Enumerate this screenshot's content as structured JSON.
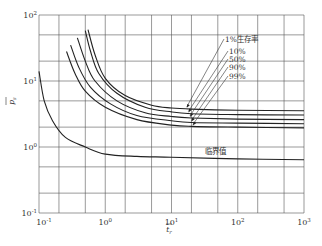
{
  "chart_data": {
    "type": "line",
    "title": "",
    "xlabel": "t_r (bar)",
    "ylabel": "p_s (bar)",
    "x_scale": "log",
    "y_scale": "log",
    "xlim": [
      0.1,
      1000
    ],
    "ylim": [
      0.1,
      100
    ],
    "x_ticks": [
      {
        "value": 0.1,
        "base": "10",
        "exp": "-1"
      },
      {
        "value": 1,
        "base": "10",
        "exp": "0"
      },
      {
        "value": 10,
        "base": "10",
        "exp": "1"
      },
      {
        "value": 100,
        "base": "10",
        "exp": "2"
      },
      {
        "value": 1000,
        "base": "10",
        "exp": "3"
      }
    ],
    "y_ticks": [
      {
        "value": 0.1,
        "base": "10",
        "exp": "-1"
      },
      {
        "value": 1,
        "base": "10",
        "exp": "0"
      },
      {
        "value": 10,
        "base": "10",
        "exp": "1"
      },
      {
        "value": 100,
        "base": "10",
        "exp": "2"
      }
    ],
    "x_grid": [
      0.1,
      0.2,
      0.5,
      1,
      2,
      5,
      10,
      20,
      50,
      100,
      200,
      500,
      1000
    ],
    "y_grid": [
      0.1,
      0.2,
      0.5,
      1,
      2,
      5,
      10,
      20,
      50,
      100
    ],
    "grid": true,
    "series": [
      {
        "name": "1%生存率",
        "points": [
          [
            0.55,
            60
          ],
          [
            0.7,
            25
          ],
          [
            1,
            11
          ],
          [
            2,
            6
          ],
          [
            5,
            4.3
          ],
          [
            10,
            3.9
          ],
          [
            20,
            3.75
          ],
          [
            100,
            3.6
          ],
          [
            1000,
            3.55
          ]
        ]
      },
      {
        "name": "10%",
        "points": [
          [
            0.5,
            58
          ],
          [
            0.6,
            28
          ],
          [
            0.8,
            13
          ],
          [
            1.5,
            6.5
          ],
          [
            4,
            4
          ],
          [
            10,
            3.4
          ],
          [
            20,
            3.2
          ],
          [
            100,
            3.1
          ],
          [
            1000,
            3.05
          ]
        ]
      },
      {
        "name": "50%",
        "points": [
          [
            0.38,
            45
          ],
          [
            0.5,
            20
          ],
          [
            0.7,
            10
          ],
          [
            1.5,
            5
          ],
          [
            4,
            3.3
          ],
          [
            10,
            2.9
          ],
          [
            20,
            2.75
          ],
          [
            100,
            2.65
          ],
          [
            1000,
            2.6
          ]
        ]
      },
      {
        "name": "90%",
        "points": [
          [
            0.3,
            35
          ],
          [
            0.4,
            16
          ],
          [
            0.6,
            8
          ],
          [
            1.2,
            4.5
          ],
          [
            3,
            3
          ],
          [
            10,
            2.5
          ],
          [
            20,
            2.35
          ],
          [
            100,
            2.3
          ],
          [
            1000,
            2.25
          ]
        ]
      },
      {
        "name": "99%",
        "points": [
          [
            0.26,
            28
          ],
          [
            0.35,
            13
          ],
          [
            0.5,
            7
          ],
          [
            1,
            4
          ],
          [
            3,
            2.6
          ],
          [
            10,
            2.15
          ],
          [
            20,
            2.05
          ],
          [
            100,
            2.0
          ],
          [
            1000,
            1.95
          ]
        ]
      },
      {
        "name": "临界值",
        "points": [
          [
            0.1,
            14
          ],
          [
            0.12,
            5
          ],
          [
            0.16,
            2.5
          ],
          [
            0.25,
            1.4
          ],
          [
            0.5,
            1.0
          ],
          [
            1,
            0.78
          ],
          [
            3,
            0.72
          ],
          [
            10,
            0.7
          ],
          [
            100,
            0.66
          ],
          [
            1000,
            0.64
          ]
        ]
      }
    ],
    "annotations": [
      {
        "text": "1%生存率",
        "series": "1%生存率",
        "arrow_to_x": 17
      },
      {
        "text": "10%",
        "series": "10%",
        "arrow_to_x": 18
      },
      {
        "text": "50%",
        "series": "50%",
        "arrow_to_x": 19
      },
      {
        "text": "90%",
        "series": "90%",
        "arrow_to_x": 20
      },
      {
        "text": "99%",
        "series": "99%",
        "arrow_to_x": 21
      },
      {
        "text": "临界值",
        "series": "临界值"
      }
    ],
    "legend": "none"
  }
}
